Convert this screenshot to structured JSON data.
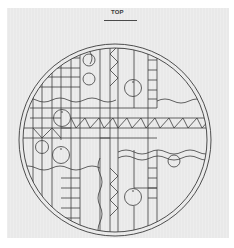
{
  "drawing": {
    "title": "TOP",
    "paper_color": "#e9e9e9",
    "line_color": "#3c3c3c",
    "circle": {
      "cx": 115,
      "cy": 140,
      "outer_r": 96,
      "inner_r": 92
    },
    "elements": {
      "small_circles": [
        {
          "cx": 89,
          "cy": 60,
          "r": 6
        },
        {
          "cx": 89,
          "cy": 79,
          "r": 6
        },
        {
          "cx": 133,
          "cy": 88,
          "r": 8.5
        },
        {
          "cx": 62,
          "cy": 118,
          "r": 8.5
        },
        {
          "cx": 42,
          "cy": 147,
          "r": 6.5
        },
        {
          "cx": 61,
          "cy": 155,
          "r": 8.5
        },
        {
          "cx": 174,
          "cy": 161,
          "r": 6
        },
        {
          "cx": 133,
          "cy": 197,
          "r": 8.5
        }
      ],
      "horizontal_zigzag_band": {
        "y_top": 118,
        "y_bottom": 128,
        "x_start": 71,
        "x_end": 211
      },
      "vertical_zigzag_column": {
        "x_left": 110,
        "x_right": 118
      }
    }
  }
}
